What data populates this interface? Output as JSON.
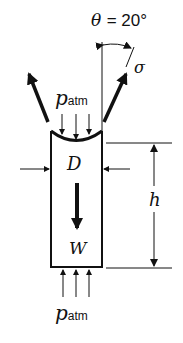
{
  "diagram": {
    "angle_label": {
      "symbol": "θ",
      "equals": "= 20°",
      "value_deg": 20
    },
    "surface_tension_label": "σ",
    "pressure_top": {
      "symbol": "p",
      "subscript": "atm"
    },
    "pressure_bottom": {
      "symbol": "p",
      "subscript": "atm"
    },
    "diameter_label": "D",
    "weight_label": "W",
    "height_label": "h"
  }
}
